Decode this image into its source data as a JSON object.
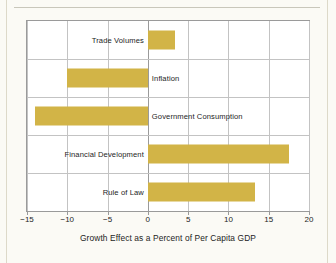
{
  "chart_data": {
    "type": "bar",
    "orientation": "horizontal",
    "title": "",
    "xlabel": "Growth Effect as a Percent of Per Capita GDP",
    "ylabel": "",
    "categories": [
      "Trade Volumes",
      "Inflation",
      "Government Consumption",
      "Financial Development",
      "Rule of Law"
    ],
    "values": [
      3.4,
      -10.0,
      -14.0,
      17.5,
      13.3
    ],
    "xlim": [
      -15,
      20
    ],
    "xticks": [
      -15,
      -10,
      -5,
      0,
      5,
      10,
      15,
      20
    ],
    "xtick_labels": [
      "−15",
      "−10",
      "−5",
      "0",
      "5",
      "10",
      "15",
      "20"
    ],
    "grid": true,
    "legend": null,
    "bar_color": "#d2b447",
    "gridline_color": "#c3c3c3",
    "axis_color": "#9a9a9a",
    "plot_background": "#ffffff",
    "page_background": "#fbfaf5"
  }
}
